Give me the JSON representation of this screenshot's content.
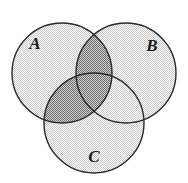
{
  "figure": {
    "type": "venn-diagram",
    "sets": 3,
    "canvas": {
      "width": 188,
      "height": 183
    },
    "background_color": "#ffffff",
    "outline_color": "#2b2b2b",
    "base_fill_color": "#e8e8e8",
    "highlight_fill_color": "#a8a8a8",
    "shaded_region_description": "A intersect (B union C)",
    "circles": [
      {
        "id": "A",
        "label": "A",
        "cx": 62,
        "cy": 73,
        "r": 50,
        "label_x": 35,
        "label_y": 45
      },
      {
        "id": "B",
        "label": "B",
        "cx": 126,
        "cy": 73,
        "r": 50,
        "label_x": 152,
        "label_y": 47
      },
      {
        "id": "C",
        "label": "C",
        "cx": 94,
        "cy": 123,
        "r": 50,
        "label_x": 94,
        "label_y": 158
      }
    ],
    "regions": [
      {
        "id": "A-only",
        "sets": [
          "A"
        ],
        "shaded": false
      },
      {
        "id": "B-only",
        "sets": [
          "B"
        ],
        "shaded": false
      },
      {
        "id": "C-only",
        "sets": [
          "C"
        ],
        "shaded": false
      },
      {
        "id": "A-and-B",
        "sets": [
          "A",
          "B"
        ],
        "shaded": true
      },
      {
        "id": "A-and-C",
        "sets": [
          "A",
          "C"
        ],
        "shaded": true
      },
      {
        "id": "B-and-C",
        "sets": [
          "B",
          "C"
        ],
        "shaded": false
      },
      {
        "id": "A-and-B-and-C",
        "sets": [
          "A",
          "B",
          "C"
        ],
        "shaded": true
      }
    ]
  },
  "chart_data": {
    "type": "venn",
    "title": "",
    "xlabel": "",
    "ylabel": "",
    "categories": [
      "A",
      "B",
      "C"
    ],
    "legend": [],
    "annotations": [
      "A",
      "B",
      "C"
    ],
    "shaded_set_expression": "A ∩ (B ∪ C)",
    "region_shading": {
      "A": false,
      "B": false,
      "C": false,
      "AB": true,
      "AC": true,
      "BC": false,
      "ABC": true
    }
  }
}
